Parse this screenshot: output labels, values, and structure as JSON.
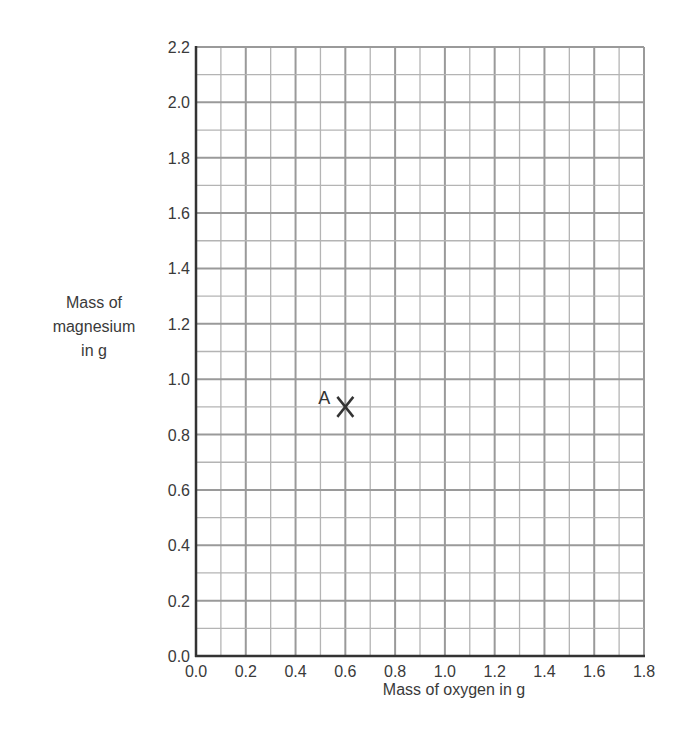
{
  "chart_data": {
    "type": "scatter",
    "title": "",
    "xlabel": "Mass of oxygen in g",
    "ylabel": "Mass of magnesium in g",
    "ylabel_lines": [
      "Mass of",
      "magnesium",
      "in g"
    ],
    "xlim": [
      0.0,
      1.8
    ],
    "ylim": [
      0.0,
      2.2
    ],
    "x_ticks": [
      "0.0",
      "0.2",
      "0.4",
      "0.6",
      "0.8",
      "1.0",
      "1.2",
      "1.4",
      "1.6",
      "1.8"
    ],
    "y_ticks": [
      "0.0",
      "0.2",
      "0.4",
      "0.6",
      "0.8",
      "1.0",
      "1.2",
      "1.4",
      "1.6",
      "1.8",
      "2.0",
      "2.2"
    ],
    "grid": true,
    "grid_minor_step_x": 0.1,
    "grid_minor_step_y": 0.1,
    "legend": null,
    "points": [
      {
        "label": "A",
        "x": 0.6,
        "y": 0.9,
        "marker": "X"
      }
    ]
  }
}
